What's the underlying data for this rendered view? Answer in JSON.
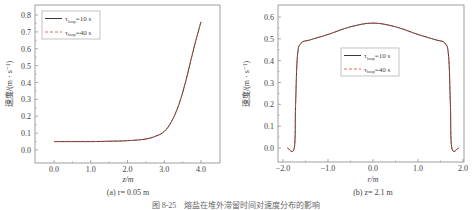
{
  "caption": "图 8-25　熔盐在堆外滞留时间对速度分布的影响",
  "colors": {
    "series1": "#222222",
    "series2": "#e0483a",
    "axis": "#888888"
  },
  "chart_data": [
    {
      "type": "line",
      "subtitle": "(a) r= 0.05 m",
      "xlabel": "z/m",
      "ylabel": "速度/(m · s⁻¹)",
      "xlim": [
        -0.5,
        4.5
      ],
      "ylim": [
        -0.08,
        0.85
      ],
      "xticks": [
        "0.0",
        "1.0",
        "2.0",
        "3.0",
        "4.0"
      ],
      "yticks": [
        "0.0",
        "0.1",
        "0.2",
        "0.3",
        "0.4",
        "0.5",
        "0.6",
        "0.7",
        "0.8"
      ],
      "grid": false,
      "legend_position": "upper-left",
      "x": [
        0.0,
        0.5,
        1.0,
        1.5,
        2.0,
        2.5,
        2.8,
        3.0,
        3.2,
        3.4,
        3.6,
        3.8,
        4.0
      ],
      "series": [
        {
          "name": "τloop=10 s",
          "style": "solid",
          "values": [
            0.05,
            0.05,
            0.05,
            0.052,
            0.055,
            0.065,
            0.085,
            0.11,
            0.17,
            0.27,
            0.42,
            0.6,
            0.76
          ]
        },
        {
          "name": "τloop=40 s",
          "style": "dashed",
          "values": [
            0.05,
            0.05,
            0.05,
            0.052,
            0.055,
            0.065,
            0.085,
            0.11,
            0.17,
            0.27,
            0.42,
            0.6,
            0.76
          ]
        }
      ]
    },
    {
      "type": "line",
      "subtitle": "(b) z= 2.1 m",
      "xlabel": "r/m",
      "ylabel": "速度/(m · s⁻¹)",
      "xlim": [
        -2.1,
        2.0
      ],
      "ylim": [
        -0.05,
        0.65
      ],
      "xticks": [
        "−2.0",
        "−1.0",
        "0.0",
        "1.0",
        "2.0"
      ],
      "yticks": [
        "0.0",
        "0.1",
        "0.2",
        "0.3",
        "0.4",
        "0.5",
        "0.6"
      ],
      "grid": false,
      "legend_position": "center",
      "x": [
        -1.9,
        -1.75,
        -1.72,
        -1.68,
        -1.6,
        -1.4,
        -1.0,
        -0.5,
        0.0,
        0.5,
        1.0,
        1.4,
        1.6,
        1.68,
        1.72,
        1.75,
        1.9
      ],
      "series": [
        {
          "name": "τloop=10 s",
          "style": "solid",
          "values": [
            0,
            0,
            0.2,
            0.42,
            0.48,
            0.495,
            0.52,
            0.555,
            0.572,
            0.555,
            0.52,
            0.495,
            0.48,
            0.42,
            0.2,
            0,
            0
          ]
        },
        {
          "name": "τloop=40 s",
          "style": "dashed",
          "values": [
            0,
            0,
            0.2,
            0.42,
            0.48,
            0.495,
            0.52,
            0.555,
            0.572,
            0.555,
            0.52,
            0.495,
            0.48,
            0.42,
            0.2,
            0,
            0
          ]
        }
      ]
    }
  ],
  "legend": {
    "tau": "τ",
    "sub": "loop",
    "items": [
      "=10 s",
      "=40 s"
    ]
  }
}
